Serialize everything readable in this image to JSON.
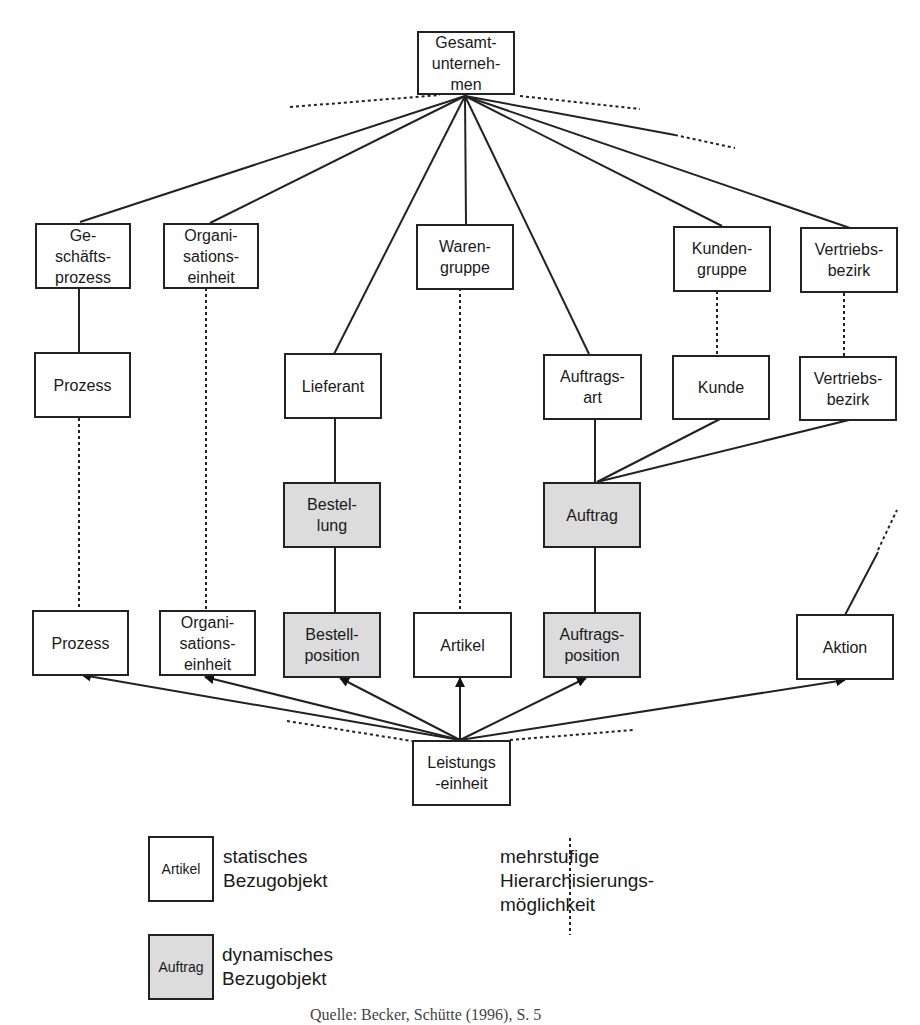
{
  "diagram": {
    "root": "Gesamt-\nunterneh-\nmen",
    "level1": {
      "geschaeftsprozess": "Ge-\nschäfts-\nprozess",
      "organisationseinheit": "Organi-\nsations-\neinheit",
      "warengruppe": "Waren-\ngruppe",
      "kundengruppe": "Kunden-\ngruppe",
      "vertriebsbezirk": "Vertriebs-\nbezirk"
    },
    "level2": {
      "prozess": "Prozess",
      "lieferant": "Lieferant",
      "auftragsart": "Auftrags-\nart",
      "kunde": "Kunde",
      "vertriebsbezirk": "Vertriebs-\nbezirk"
    },
    "level3": {
      "bestellung": "Bestel-\nlung",
      "auftrag": "Auftrag"
    },
    "level4": {
      "prozess": "Prozess",
      "organisationseinheit": "Organi-\nsations-\neinheit",
      "bestellposition": "Bestell-\nposition",
      "artikel": "Artikel",
      "auftragsposition": "Auftrags-\nposition",
      "aktion": "Aktion"
    },
    "base": "Leistungs\n-einheit"
  },
  "legend": {
    "static_example": "Artikel",
    "static_label": "statisches\nBezugobjekt",
    "dynamic_example": "Auftrag",
    "dynamic_label": "dynamisches\nBezugobjekt",
    "dotted_label": "mehrstufige\nHierarchisierungs-\nmöglichkeit"
  },
  "colors": {
    "static_fill": "#ffffff",
    "dynamic_fill": "#dcdcdc",
    "line": "#222222"
  },
  "caption": "Quelle: Becker, Schütte (1996), S. 5"
}
